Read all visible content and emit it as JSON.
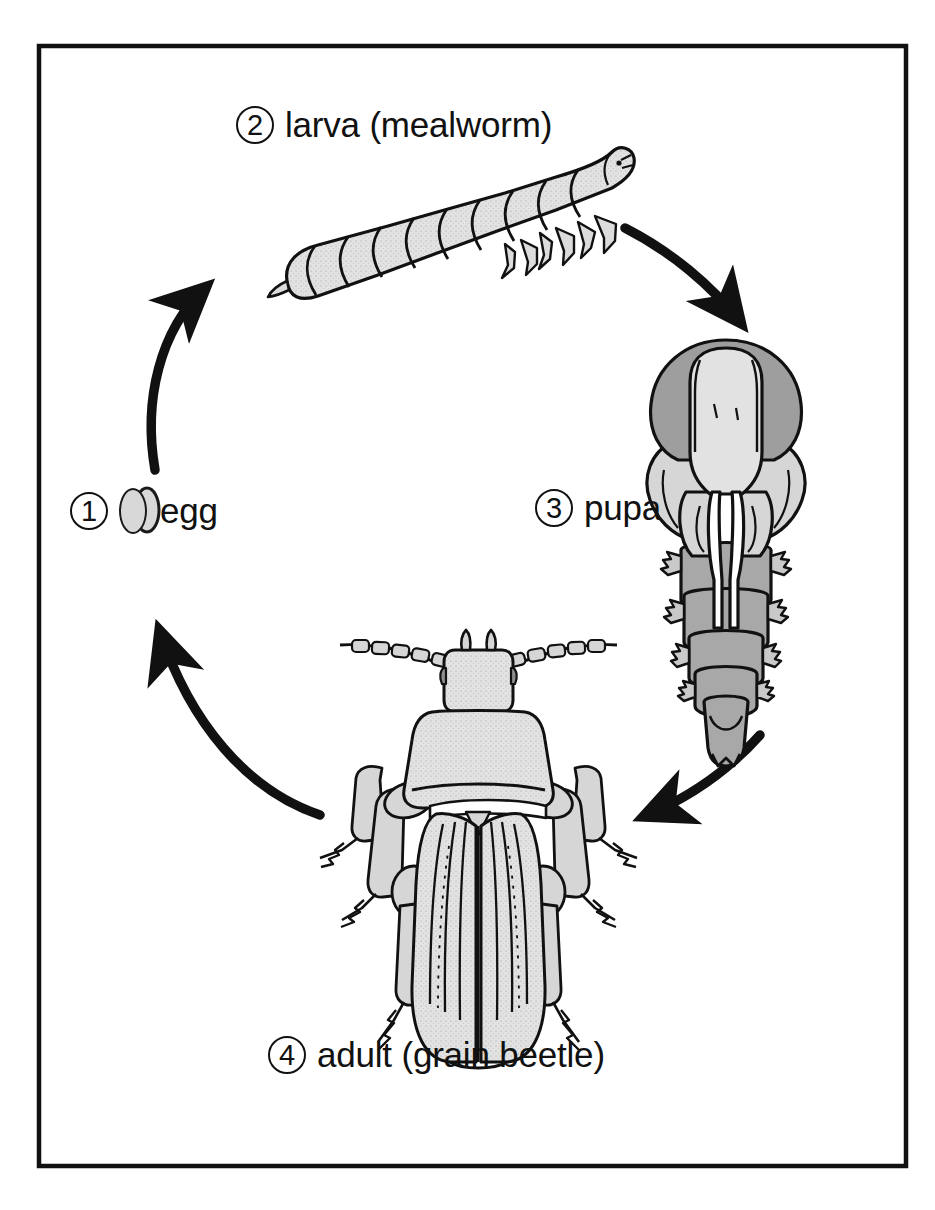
{
  "figure": {
    "border_color": "#111111",
    "background_color": "#ffffff",
    "stages": [
      {
        "number": "1",
        "label": "egg",
        "icon": "egg-oval-icon",
        "position": "left"
      },
      {
        "number": "2",
        "label": "larva (mealworm)",
        "icon": "mealworm-larva-illustration",
        "position": "top"
      },
      {
        "number": "3",
        "label": "pupa",
        "icon": "beetle-pupa-illustration",
        "position": "right"
      },
      {
        "number": "4",
        "label": "adult (grain beetle)",
        "icon": "grain-beetle-illustration",
        "position": "bottom"
      }
    ],
    "arrows": [
      {
        "name": "arrow-egg-to-larva",
        "from": "egg",
        "to": "larva"
      },
      {
        "name": "arrow-larva-to-pupa",
        "from": "larva",
        "to": "pupa"
      },
      {
        "name": "arrow-pupa-to-adult",
        "from": "pupa",
        "to": "adult"
      },
      {
        "name": "arrow-adult-to-egg",
        "from": "adult",
        "to": "egg"
      }
    ],
    "colors": {
      "outline": "#111111",
      "fill_light": "#e2e2e2",
      "fill_mid": "#cfcfcf",
      "fill_dark": "#a8a8a8",
      "egg_fill": "#d8d8d8"
    }
  }
}
